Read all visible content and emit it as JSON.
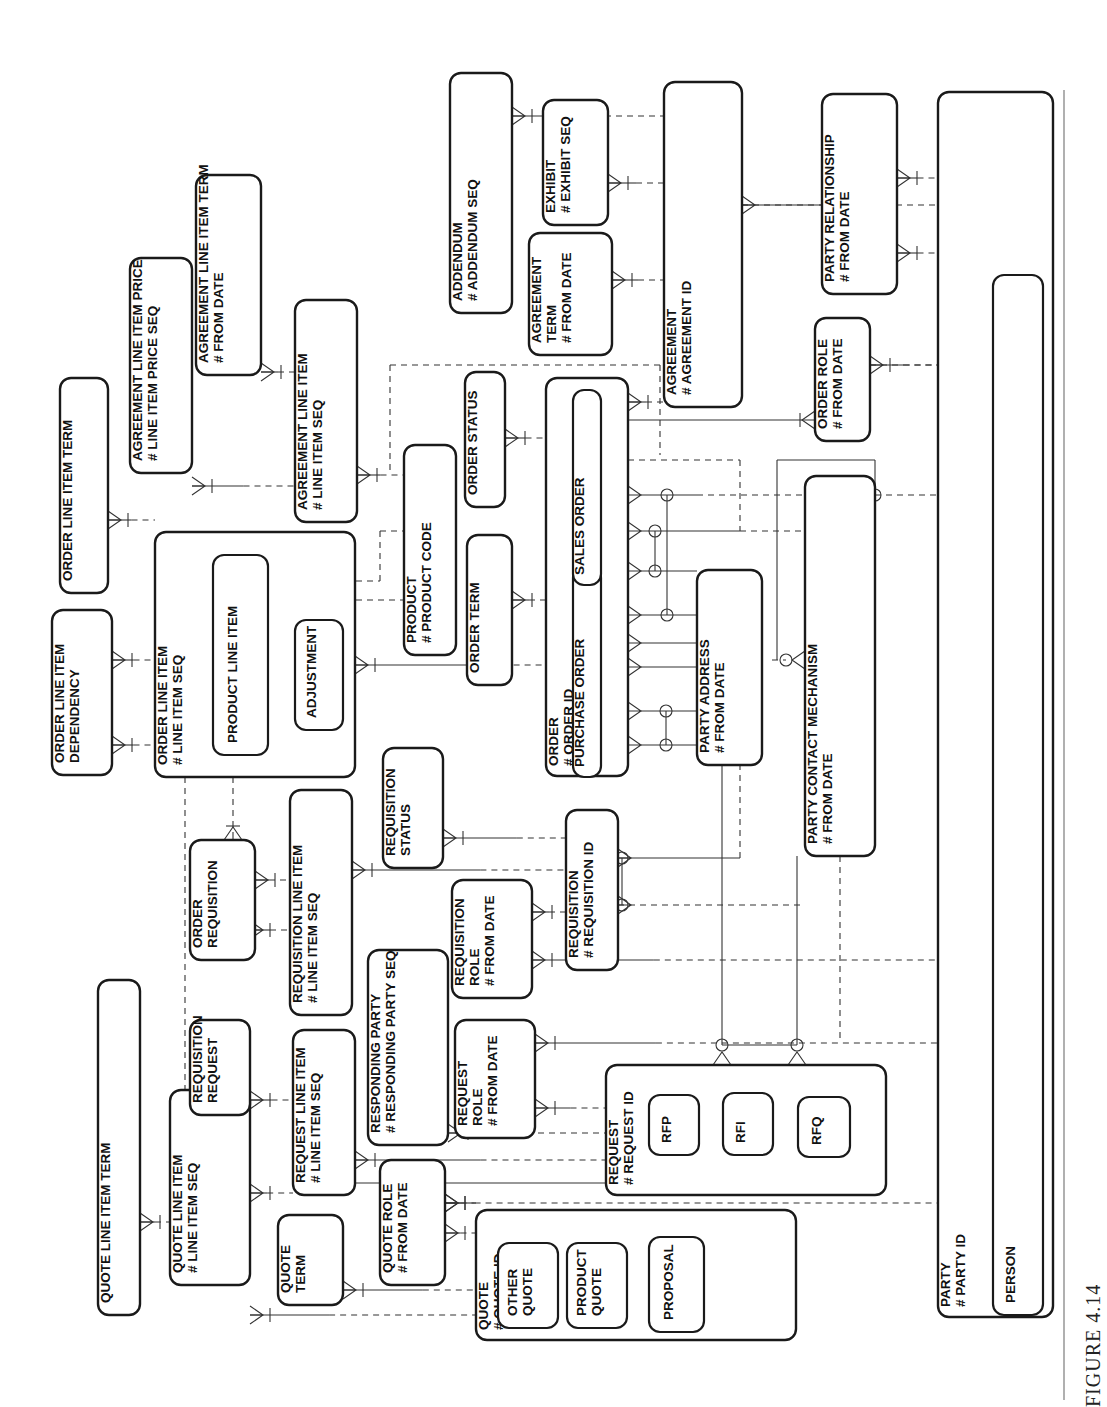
{
  "figure": {
    "caption": "FIGURE 4.14"
  },
  "entities": {
    "quote_line_item_term": {
      "name": "QUOTE LINE ITEM TERM",
      "attrs": []
    },
    "quote_line_item": {
      "name": "QUOTE LINE ITEM",
      "attrs": [
        "# LINE ITEM SEQ"
      ]
    },
    "quote_term": {
      "name": "QUOTE",
      "name2": "TERM",
      "attrs": []
    },
    "quote_role": {
      "name": "QUOTE ROLE",
      "attrs": [
        "# FROM DATE"
      ]
    },
    "quote": {
      "name": "QUOTE",
      "attrs": [
        "# QUOTE ID"
      ],
      "subtypes": [
        "OTHER QUOTE",
        "PRODUCT QUOTE",
        "PROPOSAL"
      ]
    },
    "requisition_request": {
      "name": "REQUISITION",
      "name2": "REQUEST",
      "attrs": []
    },
    "request_line_item": {
      "name": "REQUEST LINE ITEM",
      "attrs": [
        "# LINE ITEM SEQ"
      ]
    },
    "responding_party": {
      "name": "RESPONDING PARTY",
      "attrs": [
        "# RESPONDING PARTY SEQ"
      ]
    },
    "request_role": {
      "name": "REQUEST",
      "name2": "ROLE",
      "attrs": [
        "# FROM DATE"
      ]
    },
    "request": {
      "name": "REQUEST",
      "attrs": [
        "# REQUEST ID"
      ],
      "subtypes": [
        "RFP",
        "RFI",
        "RFQ"
      ]
    },
    "order_requisition": {
      "name": "ORDER",
      "name2": "REQUISITION",
      "attrs": []
    },
    "requisition_line_item": {
      "name": "REQUISITION LINE ITEM",
      "attrs": [
        "# LINE ITEM SEQ"
      ]
    },
    "requisition_status": {
      "name": "REQUISITION",
      "name2": "STATUS",
      "attrs": []
    },
    "requisition_role": {
      "name": "REQUISITION",
      "name2": "ROLE",
      "attrs": [
        "# FROM DATE"
      ]
    },
    "requisition": {
      "name": "REQUISITION",
      "attrs": [
        "# REQUISITION ID"
      ]
    },
    "order_line_item_dependency": {
      "name": "ORDER LINE ITEM",
      "name2": "DEPENDENCY",
      "attrs": []
    },
    "order_line_item_term": {
      "name": "ORDER LINE ITEM TERM",
      "attrs": []
    },
    "order_line_item": {
      "name": "ORDER LINE ITEM",
      "attrs": [
        "# LINE ITEM SEQ"
      ],
      "subtypes": [
        "PRODUCT LINE ITEM",
        "ADJUSTMENT"
      ]
    },
    "agreement_line_item_price": {
      "name": "AGREEMENT LINE ITEM PRICE",
      "attrs": [
        "# LINE ITEM PRICE SEQ"
      ]
    },
    "agreement_line_item_term": {
      "name": "AGREEMENT LINE ITEM TERM",
      "attrs": [
        "# FROM DATE"
      ]
    },
    "agreement_line_item": {
      "name": "AGREEMENT LINE ITEM",
      "attrs": [
        "# LINE ITEM SEQ"
      ]
    },
    "product": {
      "name": "PRODUCT",
      "attrs": [
        "# PRODUCT CODE"
      ]
    },
    "order_term": {
      "name": "ORDER TERM",
      "attrs": []
    },
    "order_status": {
      "name": "ORDER STATUS",
      "attrs": []
    },
    "order": {
      "name": "ORDER",
      "attrs": [
        "# ORDER ID"
      ],
      "subtypes": [
        "PURCHASE ORDER",
        "SALES ORDER"
      ]
    },
    "party_address": {
      "name": "PARTY ADDRESS",
      "attrs": [
        "# FROM DATE"
      ]
    },
    "party_contact_mechanism": {
      "name": "PARTY CONTACT MECHANISM",
      "attrs": [
        "# FROM DATE"
      ]
    },
    "addendum": {
      "name": "ADDENDUM",
      "attrs": [
        "# ADDENDUM SEQ"
      ]
    },
    "agreement_term": {
      "name": "AGREEMENT",
      "name2": "TERM",
      "attrs": [
        "# FROM DATE"
      ]
    },
    "exhibit": {
      "name": "EXHIBIT",
      "attrs": [
        "# EXHIBIT SEQ"
      ]
    },
    "agreement": {
      "name": "AGREEMENT",
      "attrs": [
        "# AGREEMENT ID"
      ]
    },
    "order_role": {
      "name": "ORDER ROLE",
      "attrs": [
        "# FROM DATE"
      ]
    },
    "party_relationship": {
      "name": "PARTY RELATIONSHIP",
      "attrs": [
        "# FROM DATE"
      ]
    },
    "party": {
      "name": "PARTY",
      "attrs": [
        "# PARTY ID"
      ],
      "subtypes": [
        "PERSON"
      ]
    }
  },
  "relationships": [
    {
      "from": "quote_line_item_term",
      "to": "quote_line_item"
    },
    {
      "from": "quote_line_item",
      "to": "request_line_item"
    },
    {
      "from": "quote_line_item",
      "to": "quote"
    },
    {
      "from": "quote_term",
      "to": "quote"
    },
    {
      "from": "quote_role",
      "to": "quote"
    },
    {
      "from": "quote_role",
      "to": "party"
    },
    {
      "from": "requisition_request",
      "to": "request_line_item"
    },
    {
      "from": "requisition_request",
      "to": "requisition_line_item"
    },
    {
      "from": "request_line_item",
      "to": "request"
    },
    {
      "from": "responding_party",
      "to": "request"
    },
    {
      "from": "responding_party",
      "to": "party"
    },
    {
      "from": "request_role",
      "to": "request"
    },
    {
      "from": "request_role",
      "to": "party"
    },
    {
      "from": "request",
      "to": "party_address"
    },
    {
      "from": "request",
      "to": "party_contact_mechanism"
    },
    {
      "from": "order_requisition",
      "to": "requisition_line_item"
    },
    {
      "from": "order_requisition",
      "to": "order_line_item"
    },
    {
      "from": "requisition_line_item",
      "to": "requisition"
    },
    {
      "from": "requisition_status",
      "to": "requisition"
    },
    {
      "from": "requisition_role",
      "to": "requisition"
    },
    {
      "from": "requisition_role",
      "to": "party"
    },
    {
      "from": "requisition",
      "to": "party_address"
    },
    {
      "from": "requisition",
      "to": "party_contact_mechanism"
    },
    {
      "from": "order_line_item_dependency",
      "to": "order_line_item"
    },
    {
      "from": "order_line_item_term",
      "to": "order_line_item"
    },
    {
      "from": "order_line_item",
      "to": "order"
    },
    {
      "from": "order_line_item",
      "to": "product"
    },
    {
      "from": "agreement_line_item_price",
      "to": "agreement_line_item"
    },
    {
      "from": "agreement_line_item_term",
      "to": "agreement_line_item"
    },
    {
      "from": "agreement_line_item",
      "to": "product"
    },
    {
      "from": "agreement_line_item",
      "to": "agreement"
    },
    {
      "from": "order_term",
      "to": "order"
    },
    {
      "from": "order_status",
      "to": "order"
    },
    {
      "from": "order",
      "to": "agreement"
    },
    {
      "from": "order",
      "to": "order_role"
    },
    {
      "from": "order",
      "to": "party_address"
    },
    {
      "from": "order",
      "to": "party_contact_mechanism"
    },
    {
      "from": "party_address",
      "to": "party_contact_mechanism"
    },
    {
      "from": "party_contact_mechanism",
      "to": "party"
    },
    {
      "from": "addendum",
      "to": "agreement"
    },
    {
      "from": "agreement_term",
      "to": "agreement"
    },
    {
      "from": "exhibit",
      "to": "agreement"
    },
    {
      "from": "agreement",
      "to": "party"
    },
    {
      "from": "order_role",
      "to": "party"
    },
    {
      "from": "party_relationship",
      "to": "party"
    }
  ]
}
